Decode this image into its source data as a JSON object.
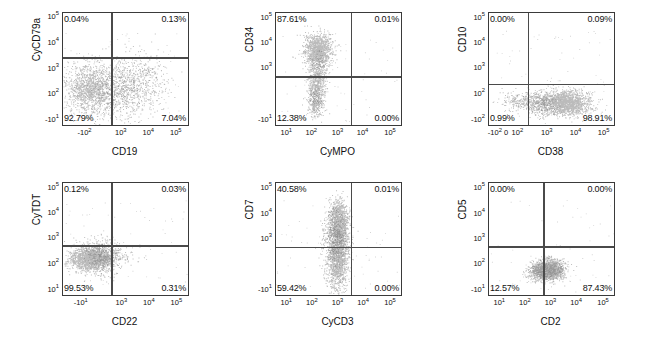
{
  "figure": {
    "type": "flow-cytometry-dot-plot-grid",
    "rows": 2,
    "cols": 3,
    "dot_color": "#787878",
    "axis_color": "#3a3a3a"
  },
  "chart_data": {
    "type": "scatter",
    "title": "",
    "panels": [
      {
        "id": "panel-cd79a-cd19",
        "xlabel": "CD19",
        "ylabel": "CyCD79a",
        "xticks": [
          "-10²",
          "10³",
          "10⁴",
          "10⁵"
        ],
        "xtick_pos": [
          0.18,
          0.47,
          0.69,
          0.91
        ],
        "yticks": [
          "10⁵",
          "10⁴",
          "10³",
          "10²",
          "-10¹"
        ],
        "ytick_pos": [
          0.04,
          0.27,
          0.5,
          0.72,
          0.955
        ],
        "quadrant_x": 0.385,
        "quadrant_y": 0.395,
        "quadrants": {
          "upper_left": "0.04%",
          "upper_right": "0.13%",
          "lower_left": "92.79%",
          "lower_right": "7.04%"
        },
        "clusters": [
          {
            "cx": 0.23,
            "cy": 0.68,
            "sx": 0.105,
            "sy": 0.115,
            "n": 1500
          },
          {
            "cx": 0.5,
            "cy": 0.66,
            "sx": 0.115,
            "sy": 0.135,
            "n": 700
          },
          {
            "cx": 0.68,
            "cy": 0.6,
            "sx": 0.1,
            "sy": 0.14,
            "n": 220
          }
        ]
      },
      {
        "id": "panel-cd34-cympo",
        "xlabel": "CyMPO",
        "ylabel": "CD34",
        "xticks": [
          "10¹",
          "10²",
          "10³",
          "10⁴",
          "10⁵"
        ],
        "xtick_pos": [
          0.09,
          0.29,
          0.5,
          0.7,
          0.92
        ],
        "yticks": [
          "10⁵",
          "10⁴",
          "10³",
          "-10¹"
        ],
        "ytick_pos": [
          0.045,
          0.27,
          0.495,
          0.955
        ],
        "quadrant_x": 0.6,
        "quadrant_y": 0.565,
        "quadrants": {
          "upper_left": "87.61%",
          "upper_right": "0.01%",
          "lower_left": "12.38%",
          "lower_right": "0.00%"
        },
        "clusters": [
          {
            "cx": 0.335,
            "cy": 0.335,
            "sx": 0.055,
            "sy": 0.075,
            "n": 1300
          },
          {
            "cx": 0.325,
            "cy": 0.62,
            "sx": 0.035,
            "sy": 0.11,
            "n": 700
          },
          {
            "cx": 0.31,
            "cy": 0.8,
            "sx": 0.028,
            "sy": 0.07,
            "n": 230
          }
        ]
      },
      {
        "id": "panel-cd10-cd38",
        "xlabel": "CD38",
        "ylabel": "CD10",
        "xticks": [
          "-10²",
          "0",
          "10²",
          "10³",
          "10⁴",
          "10⁵"
        ],
        "xtick_pos": [
          0.055,
          0.145,
          0.235,
          0.47,
          0.7,
          0.925
        ],
        "yticks": [
          "10⁵",
          "10⁴",
          "10³",
          "10²",
          "-10²"
        ],
        "ytick_pos": [
          0.045,
          0.27,
          0.495,
          0.72,
          0.955
        ],
        "quadrant_x": 0.31,
        "quadrant_y": 0.63,
        "quadrants": {
          "upper_left": "0.00%",
          "upper_right": "0.09%",
          "lower_left": "0.99%",
          "lower_right": "98.91%"
        },
        "clusters": [
          {
            "cx": 0.6,
            "cy": 0.8,
            "sx": 0.1,
            "sy": 0.055,
            "n": 1800
          },
          {
            "cx": 0.38,
            "cy": 0.8,
            "sx": 0.07,
            "sy": 0.05,
            "n": 420
          },
          {
            "cx": 0.2,
            "cy": 0.785,
            "sx": 0.07,
            "sy": 0.045,
            "n": 120
          }
        ]
      },
      {
        "id": "panel-cytdt-cd22",
        "xlabel": "CD22",
        "ylabel": "CyTDT",
        "xticks": [
          "-10¹",
          "10³",
          "10⁴",
          "10⁵"
        ],
        "xtick_pos": [
          0.15,
          0.475,
          0.695,
          0.915
        ],
        "yticks": [
          "10⁵",
          "10⁴",
          "10³",
          "10²",
          "10¹"
        ],
        "ytick_pos": [
          0.045,
          0.27,
          0.495,
          0.72,
          0.955
        ],
        "quadrant_x": 0.385,
        "quadrant_y": 0.555,
        "quadrants": {
          "upper_left": "0.12%",
          "upper_right": "0.03%",
          "lower_left": "99.53%",
          "lower_right": "0.31%"
        },
        "clusters": [
          {
            "cx": 0.22,
            "cy": 0.675,
            "sx": 0.085,
            "sy": 0.055,
            "n": 1700
          },
          {
            "cx": 0.33,
            "cy": 0.645,
            "sx": 0.07,
            "sy": 0.075,
            "n": 420
          },
          {
            "cx": 0.47,
            "cy": 0.645,
            "sx": 0.1,
            "sy": 0.055,
            "n": 90
          }
        ]
      },
      {
        "id": "panel-cd7-cycd3",
        "xlabel": "CyCD3",
        "ylabel": "CD7",
        "xticks": [
          "10¹",
          "10²",
          "10³",
          "10⁴",
          "10⁵"
        ],
        "xtick_pos": [
          0.09,
          0.295,
          0.5,
          0.705,
          0.92
        ],
        "yticks": [
          "10⁵",
          "10⁴",
          "10³",
          "-10¹"
        ],
        "ytick_pos": [
          0.045,
          0.275,
          0.5,
          0.955
        ],
        "quadrant_x": 0.6,
        "quadrant_y": 0.57,
        "quadrants": {
          "upper_left": "40.58%",
          "upper_right": "0.01%",
          "lower_left": "59.42%",
          "lower_right": "0.00%"
        },
        "clusters": [
          {
            "cx": 0.5,
            "cy": 0.36,
            "sx": 0.038,
            "sy": 0.1,
            "n": 1200
          },
          {
            "cx": 0.495,
            "cy": 0.67,
            "sx": 0.04,
            "sy": 0.12,
            "n": 1400
          },
          {
            "cx": 0.455,
            "cy": 0.52,
            "sx": 0.05,
            "sy": 0.16,
            "n": 400
          }
        ]
      },
      {
        "id": "panel-cd5-cd2",
        "xlabel": "CD2",
        "ylabel": "CD5",
        "xticks": [
          "10¹",
          "10²",
          "10³",
          "10⁴",
          "10⁵"
        ],
        "xtick_pos": [
          0.09,
          0.295,
          0.5,
          0.705,
          0.92
        ],
        "yticks": [
          "10⁵",
          "10⁴",
          "10³",
          "10²",
          "-10¹"
        ],
        "ytick_pos": [
          0.045,
          0.275,
          0.5,
          0.725,
          0.955
        ],
        "quadrant_x": 0.435,
        "quadrant_y": 0.565,
        "quadrants": {
          "upper_left": "0.00%",
          "upper_right": "0.00%",
          "lower_left": "12.57%",
          "lower_right": "87.43%"
        },
        "clusters": [
          {
            "cx": 0.475,
            "cy": 0.775,
            "sx": 0.055,
            "sy": 0.045,
            "n": 1300
          },
          {
            "cx": 0.395,
            "cy": 0.79,
            "sx": 0.045,
            "sy": 0.04,
            "n": 380
          },
          {
            "cx": 0.52,
            "cy": 0.765,
            "sx": 0.05,
            "sy": 0.045,
            "n": 300
          }
        ]
      }
    ]
  }
}
